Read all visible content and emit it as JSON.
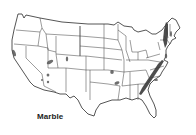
{
  "map": {
    "title": "Marble",
    "region": "Contiguous United States",
    "legend": {
      "deposit_color": "#555555",
      "boundary_color": "#3a3a3a",
      "background": "#ffffff"
    },
    "deposit_regions": [
      "Northern California (Sierra Nevada)",
      "Nevada",
      "Utah",
      "Colorado",
      "Arizona",
      "Missouri",
      "Arkansas",
      "Appalachians (Tennessee / Georgia / Alabama / Virginia)",
      "New England (Vermont / Massachusetts)",
      "Maryland / Pennsylvania"
    ]
  }
}
